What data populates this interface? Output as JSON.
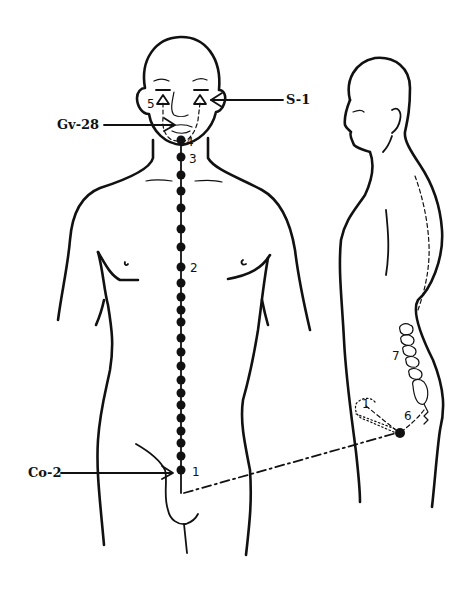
{
  "diagram": {
    "type": "acupuncture-meridian-figure",
    "figures": [
      "front-view-body",
      "side-view-body"
    ],
    "colors": {
      "ink": "#111111",
      "background": "#ffffff"
    }
  },
  "labels": {
    "s1": "S-1",
    "gv28": "Gv-28",
    "co2": "Co-2"
  },
  "points": {
    "p1": "1",
    "p2": "2",
    "p3": "3",
    "p4": "4",
    "p5": "5",
    "p6": "6",
    "p7": "7",
    "p1_side": "1"
  },
  "meridian": {
    "front_dot_count": 22,
    "dot_y": [
      140,
      157,
      175,
      191,
      208,
      229,
      247,
      267,
      283,
      297,
      310,
      322,
      338,
      352,
      366,
      380,
      393,
      405,
      418,
      431,
      443,
      456,
      470
    ]
  }
}
